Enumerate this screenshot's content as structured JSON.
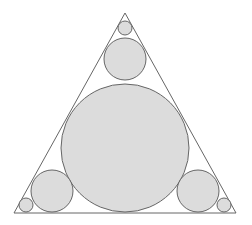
{
  "diagram": {
    "title": "",
    "colors": {
      "background": "#ffffff",
      "stroke": "#666666",
      "circle_fill": "#dcdcdc"
    },
    "triangle": {
      "points": "125,13 14,213 236,213"
    },
    "circles": [
      {
        "id": "incircle",
        "cx": 125,
        "cy": 148,
        "r": 64
      },
      {
        "id": "top-medium",
        "cx": 125,
        "cy": 59,
        "r": 21
      },
      {
        "id": "top-small",
        "cx": 125,
        "cy": 28,
        "r": 7
      },
      {
        "id": "left-medium",
        "cx": 52,
        "cy": 191,
        "r": 21
      },
      {
        "id": "left-small",
        "cx": 26,
        "cy": 205,
        "r": 7
      },
      {
        "id": "right-medium",
        "cx": 198,
        "cy": 191,
        "r": 21
      },
      {
        "id": "right-small",
        "cx": 224,
        "cy": 205,
        "r": 7
      }
    ]
  }
}
